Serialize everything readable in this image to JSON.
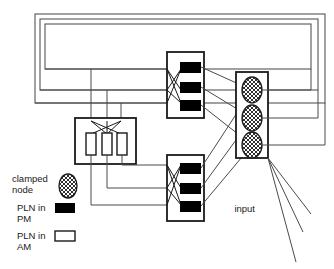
{
  "diagram": {
    "title": "",
    "colors": {
      "stroke": "#1a1a1a",
      "wire": "#4a4a4a",
      "fill_pm": "#000000",
      "fill_am": "#ffffff",
      "background": "#ffffff"
    },
    "legend": {
      "items": [
        {
          "id": "clamped-node",
          "label_line1": "clamped",
          "label_line2": "node",
          "symbol": "hatched-ellipse-icon"
        },
        {
          "id": "pln-in-pm",
          "label_line1": "PLN in",
          "label_line2": "PM",
          "symbol": "filled-rect-icon"
        },
        {
          "id": "pln-in-am",
          "label_line1": "PLN in",
          "label_line2": "AM",
          "symbol": "open-rect-icon"
        }
      ]
    },
    "annotations": {
      "input_label": "input"
    },
    "modules": {
      "outer_frames": {
        "count": 3,
        "name": "nested-frames"
      },
      "am_module": {
        "name": "pln-am-module",
        "node_count": 3,
        "node_type": "PLN in AM"
      },
      "pm_module_upper": {
        "name": "pln-pm-module-upper",
        "node_count": 3,
        "node_type": "PLN in PM"
      },
      "pm_module_lower": {
        "name": "pln-pm-module-lower",
        "node_count": 3,
        "node_type": "PLN in PM"
      },
      "clamped_module": {
        "name": "clamped-node-module",
        "node_count": 3,
        "node_type": "clamped node"
      }
    }
  }
}
